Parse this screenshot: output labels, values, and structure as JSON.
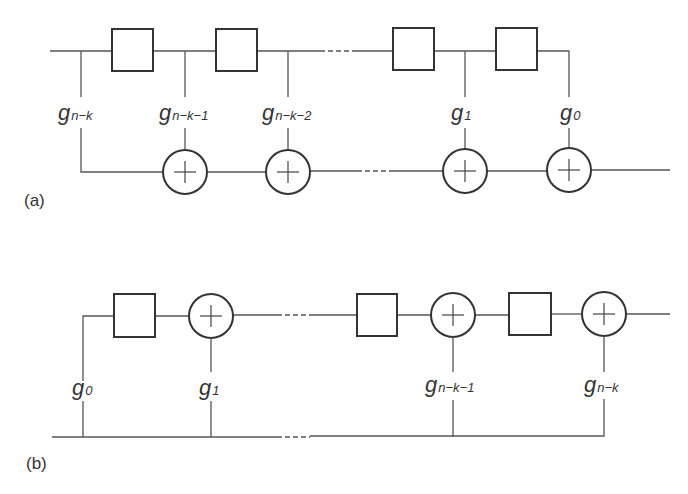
{
  "diagram": {
    "type": "shift-register circuits",
    "panels": [
      {
        "id": "a",
        "label": "(a)",
        "registers": 4,
        "adders": 4,
        "coefficients": [
          {
            "main": "g",
            "sub": "n−k"
          },
          {
            "main": "g",
            "sub": "n−k−1"
          },
          {
            "main": "g",
            "sub": "n−k−2"
          },
          {
            "main": "g",
            "sub": "1"
          },
          {
            "main": "g",
            "sub": "0"
          }
        ]
      },
      {
        "id": "b",
        "label": "(b)",
        "registers": 3,
        "adders": 3,
        "coefficients": [
          {
            "main": "g",
            "sub": "0"
          },
          {
            "main": "g",
            "sub": "1"
          },
          {
            "main": "g",
            "sub": "n−k−1"
          },
          {
            "main": "g",
            "sub": "n−k"
          }
        ]
      }
    ]
  },
  "colors": {
    "line": "#555555",
    "outline": "#333333",
    "background": "#ffffff"
  }
}
